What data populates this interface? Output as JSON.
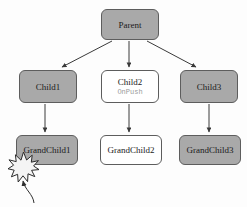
{
  "diagram": {
    "type": "component-tree",
    "background_color": "#fdfdfd",
    "filled_color": "#a9a9a9",
    "hollow_color": "#ffffff",
    "border_color": "#5d5d5d",
    "sublabel_color": "#9a9a9a",
    "nodes": [
      {
        "id": "parent",
        "label": "Parent",
        "sublabel": "",
        "fill": "filled",
        "x": 101,
        "y": 9,
        "w": 58,
        "h": 31
      },
      {
        "id": "child1",
        "label": "Child1",
        "sublabel": "",
        "fill": "filled",
        "x": 19,
        "y": 70,
        "w": 58,
        "h": 33
      },
      {
        "id": "child2",
        "label": "Child2",
        "sublabel": "OnPush",
        "fill": "hollow",
        "x": 101,
        "y": 70,
        "w": 58,
        "h": 33
      },
      {
        "id": "child3",
        "label": "Child3",
        "sublabel": "",
        "fill": "filled",
        "x": 180,
        "y": 70,
        "w": 58,
        "h": 33
      },
      {
        "id": "grandchild1",
        "label": "GrandChild1",
        "sublabel": "",
        "fill": "filled",
        "x": 16,
        "y": 135,
        "w": 62,
        "h": 30
      },
      {
        "id": "grandchild2",
        "label": "GrandChild2",
        "sublabel": "",
        "fill": "hollow",
        "x": 100,
        "y": 135,
        "w": 62,
        "h": 30
      },
      {
        "id": "grandchild3",
        "label": "GrandChild3",
        "sublabel": "",
        "fill": "filled",
        "x": 179,
        "y": 135,
        "w": 62,
        "h": 30
      }
    ],
    "edges": [
      {
        "from": "parent",
        "to": "child1",
        "style": "diagonal-arrow"
      },
      {
        "from": "parent",
        "to": "child2",
        "style": "straight-arrow"
      },
      {
        "from": "parent",
        "to": "child3",
        "style": "diagonal-arrow"
      },
      {
        "from": "child1",
        "to": "grandchild1",
        "style": "straight-arrow"
      },
      {
        "from": "child2",
        "to": "grandchild2",
        "style": "straight-arrow"
      },
      {
        "from": "child3",
        "to": "grandchild3",
        "style": "straight-arrow"
      }
    ],
    "markers": [
      {
        "id": "event-burst",
        "kind": "starburst",
        "target": "grandchild1",
        "cx": 23,
        "cy": 167,
        "r": 13
      },
      {
        "id": "burst-pointer",
        "kind": "curved-arrow",
        "from_x": 34,
        "from_y": 202,
        "to_x": 23,
        "to_y": 178
      }
    ]
  }
}
